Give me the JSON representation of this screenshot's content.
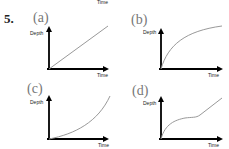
{
  "question": {
    "number": "5.",
    "top_cut_label": "Time"
  },
  "panels": [
    {
      "id": "a",
      "label": "(a)",
      "y_label": "Depth",
      "x_label": "Time",
      "curve_shape": "linear"
    },
    {
      "id": "b",
      "label": "(b)",
      "y_label": "Depth",
      "x_label": "Time",
      "curve_shape": "concave-down (rapid rise then leveling)"
    },
    {
      "id": "c",
      "label": "(c)",
      "y_label": "Depth",
      "x_label": "Time",
      "curve_shape": "concave-up (slow then accelerating)"
    },
    {
      "id": "d",
      "label": "(d)",
      "y_label": "Depth",
      "x_label": "Time",
      "curve_shape": "rise, plateau, then linear rise"
    }
  ],
  "colors": {
    "axis": "#000000",
    "curve": "#999999",
    "panel_label": "#777777"
  }
}
